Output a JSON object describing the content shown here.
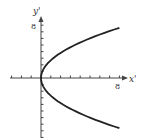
{
  "diagram": {
    "type": "parabola-plot",
    "equation_hint": "x' = y'^2 / 8 (opening right)",
    "axes": {
      "x_label": "x'",
      "y_label": "y'",
      "x_tick_label": "8",
      "y_tick_label": "8"
    },
    "colors": {
      "curve": "#222222",
      "axis": "#444444",
      "background": "#ffffff"
    }
  },
  "chart_data": {
    "type": "line",
    "title": "",
    "xlabel": "x'",
    "ylabel": "y'",
    "xlim": [
      -3,
      8.5
    ],
    "ylim": [
      -9,
      9
    ],
    "grid": false,
    "legend": "none",
    "tick_labels": {
      "x": [
        "8"
      ],
      "y": [
        "8"
      ]
    },
    "series": [
      {
        "name": "parabola",
        "points": [
          [
            8,
            -7.6
          ],
          [
            5.5,
            -6.3
          ],
          [
            3.5,
            -5.0
          ],
          [
            2,
            -3.8
          ],
          [
            0.9,
            -2.5
          ],
          [
            0.2,
            -1.2
          ],
          [
            0,
            0
          ],
          [
            0.2,
            1.2
          ],
          [
            0.9,
            2.5
          ],
          [
            2,
            3.8
          ],
          [
            3.5,
            5.0
          ],
          [
            5.5,
            6.3
          ],
          [
            8,
            7.6
          ]
        ]
      }
    ]
  }
}
